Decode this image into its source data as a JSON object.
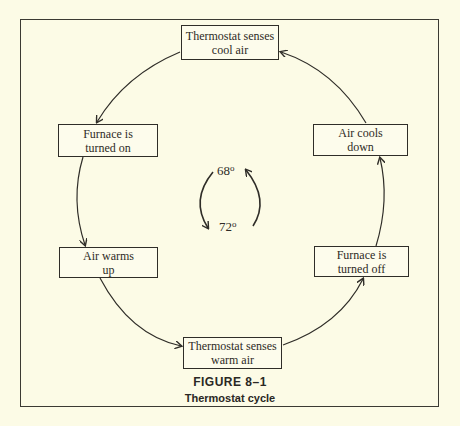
{
  "diagram": {
    "type": "cycle",
    "nodes": [
      {
        "id": "n1",
        "label": "Thermostat senses\ncool air"
      },
      {
        "id": "n2",
        "label": "Furnace is\nturned on"
      },
      {
        "id": "n3",
        "label": "Air warms\nup"
      },
      {
        "id": "n4",
        "label": "Thermostat senses\nwarm air"
      },
      {
        "id": "n5",
        "label": "Furnace is\nturned off"
      },
      {
        "id": "n6",
        "label": "Air cools\ndown"
      }
    ],
    "edges": [
      {
        "from": "n1",
        "to": "n2"
      },
      {
        "from": "n2",
        "to": "n3"
      },
      {
        "from": "n3",
        "to": "n4"
      },
      {
        "from": "n4",
        "to": "n5"
      },
      {
        "from": "n5",
        "to": "n6"
      },
      {
        "from": "n6",
        "to": "n1"
      }
    ],
    "center": {
      "top_temp": "68",
      "bottom_temp": "72",
      "degree_symbol": "o"
    }
  },
  "caption": {
    "figure": "FIGURE 8–1",
    "title": "Thermostat cycle"
  }
}
